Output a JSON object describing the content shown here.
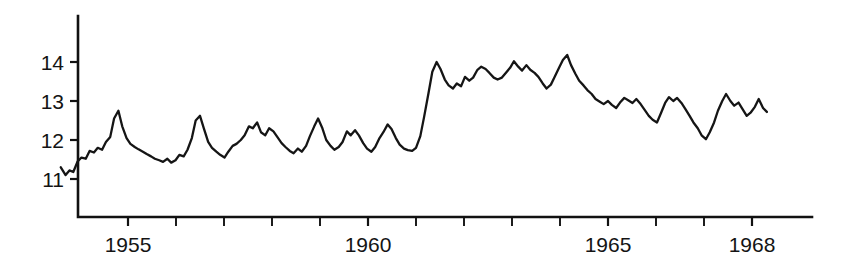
{
  "chart_data": {
    "type": "line",
    "title": "",
    "subtitle": "",
    "xlabel": "",
    "ylabel": "",
    "grid": false,
    "legend": null,
    "legend_position": "none",
    "xlim": [
      1953.55,
      1968.35
    ],
    "ylim": [
      10.55,
      14.6
    ],
    "y_ticks": [
      11,
      12,
      13,
      14
    ],
    "y_tick_labels": [
      "11",
      "12",
      "13",
      "14"
    ],
    "x_ticks": [
      1955,
      1956,
      1957,
      1958,
      1959,
      1960,
      1961,
      1962,
      1963,
      1964,
      1965,
      1966,
      1967,
      1968
    ],
    "x_tick_labels": [
      "1955",
      "",
      "",
      "",
      "",
      "1960",
      "",
      "",
      "",
      "",
      "1965",
      "",
      "",
      "1968"
    ],
    "x_labeled_ticks": [
      1955,
      1960,
      1965,
      1968
    ],
    "series": [
      {
        "name": "series-1",
        "color": "#151515",
        "x": [
          1953.6,
          1953.7,
          1953.78,
          1953.86,
          1953.95,
          1954.03,
          1954.12,
          1954.2,
          1954.29,
          1954.37,
          1954.46,
          1954.54,
          1954.63,
          1954.71,
          1954.8,
          1954.88,
          1954.97,
          1955.05,
          1955.14,
          1955.22,
          1955.31,
          1955.39,
          1955.48,
          1955.56,
          1955.65,
          1955.73,
          1955.82,
          1955.9,
          1955.99,
          1956.07,
          1956.16,
          1956.24,
          1956.33,
          1956.41,
          1956.5,
          1956.58,
          1956.67,
          1956.75,
          1956.84,
          1956.92,
          1957.01,
          1957.09,
          1957.18,
          1957.26,
          1957.35,
          1957.43,
          1957.52,
          1957.6,
          1957.69,
          1957.77,
          1957.86,
          1957.94,
          1958.03,
          1958.11,
          1958.2,
          1958.28,
          1958.37,
          1958.45,
          1958.54,
          1958.62,
          1958.71,
          1958.79,
          1958.88,
          1958.96,
          1959.05,
          1959.13,
          1959.22,
          1959.3,
          1959.39,
          1959.47,
          1959.56,
          1959.64,
          1959.73,
          1959.81,
          1959.9,
          1959.98,
          1960.07,
          1960.15,
          1960.24,
          1960.32,
          1960.41,
          1960.49,
          1960.58,
          1960.66,
          1960.75,
          1960.83,
          1960.92,
          1961.0,
          1961.09,
          1961.17,
          1961.26,
          1961.34,
          1961.43,
          1961.51,
          1961.6,
          1961.68,
          1961.77,
          1961.85,
          1961.94,
          1962.02,
          1962.11,
          1962.19,
          1962.28,
          1962.36,
          1962.45,
          1962.53,
          1962.62,
          1962.7,
          1962.79,
          1962.87,
          1962.96,
          1963.04,
          1963.13,
          1963.21,
          1963.3,
          1963.38,
          1963.47,
          1963.55,
          1963.64,
          1963.72,
          1963.81,
          1963.89,
          1963.98,
          1964.06,
          1964.15,
          1964.23,
          1964.32,
          1964.4,
          1964.49,
          1964.57,
          1964.66,
          1964.74,
          1964.83,
          1964.91,
          1965.0,
          1965.08,
          1965.17,
          1965.25,
          1965.34,
          1965.42,
          1965.51,
          1965.59,
          1965.68,
          1965.76,
          1965.85,
          1965.93,
          1966.02,
          1966.1,
          1966.19,
          1966.27,
          1966.36,
          1966.44,
          1966.53,
          1966.61,
          1966.7,
          1966.78,
          1966.87,
          1966.95,
          1967.04,
          1967.12,
          1967.21,
          1967.29,
          1967.38,
          1967.46,
          1967.55,
          1967.63,
          1967.72,
          1967.8,
          1967.89,
          1967.97,
          1968.06,
          1968.14,
          1968.23,
          1968.31
        ],
        "y": [
          11.3,
          11.1,
          11.22,
          11.18,
          11.45,
          11.55,
          11.52,
          11.72,
          11.68,
          11.8,
          11.75,
          11.95,
          12.08,
          12.55,
          12.75,
          12.35,
          12.05,
          11.9,
          11.82,
          11.76,
          11.7,
          11.64,
          11.58,
          11.52,
          11.48,
          11.44,
          11.52,
          11.42,
          11.48,
          11.62,
          11.58,
          11.75,
          12.05,
          12.5,
          12.62,
          12.3,
          11.95,
          11.8,
          11.7,
          11.62,
          11.55,
          11.7,
          11.85,
          11.9,
          12.0,
          12.12,
          12.35,
          12.3,
          12.45,
          12.2,
          12.12,
          12.3,
          12.22,
          12.08,
          11.92,
          11.82,
          11.72,
          11.66,
          11.78,
          11.7,
          11.85,
          12.1,
          12.35,
          12.55,
          12.3,
          12.0,
          11.85,
          11.75,
          11.82,
          11.95,
          12.22,
          12.12,
          12.25,
          12.12,
          11.92,
          11.78,
          11.7,
          11.82,
          12.05,
          12.2,
          12.4,
          12.28,
          12.05,
          11.88,
          11.78,
          11.74,
          11.72,
          11.8,
          12.1,
          12.6,
          13.2,
          13.75,
          14.0,
          13.82,
          13.55,
          13.4,
          13.32,
          13.45,
          13.38,
          13.62,
          13.52,
          13.6,
          13.8,
          13.88,
          13.82,
          13.72,
          13.6,
          13.55,
          13.6,
          13.72,
          13.85,
          14.02,
          13.88,
          13.78,
          13.92,
          13.8,
          13.72,
          13.62,
          13.45,
          13.32,
          13.42,
          13.62,
          13.85,
          14.05,
          14.18,
          13.92,
          13.7,
          13.52,
          13.4,
          13.28,
          13.18,
          13.05,
          12.98,
          12.92,
          13.0,
          12.9,
          12.82,
          12.96,
          13.08,
          13.02,
          12.95,
          13.05,
          12.92,
          12.78,
          12.62,
          12.52,
          12.45,
          12.68,
          12.95,
          13.1,
          13.0,
          13.08,
          12.95,
          12.8,
          12.62,
          12.45,
          12.3,
          12.12,
          12.02,
          12.2,
          12.45,
          12.75,
          13.0,
          13.18,
          13.0,
          12.88,
          12.96,
          12.8,
          12.62,
          12.7,
          12.85,
          13.05,
          12.82,
          12.72
        ]
      }
    ]
  }
}
